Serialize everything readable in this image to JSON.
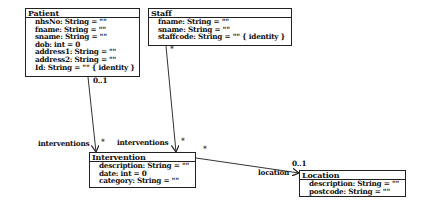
{
  "classes": {
    "patient": {
      "name": "Patient",
      "attributes": [
        "nhsNo: String = \"\"",
        "fname: String = \"\"",
        "sname: String = \"\"",
        "dob: int = 0",
        "address1: String = \"\"",
        "address2: String = \"\"",
        "Id: String = \"\" { identity }"
      ]
    },
    "staff": {
      "name": "Staff",
      "attributes": [
        "fname: String = \"\"",
        "sname: String = \"\"",
        "staffcode: String = \"\" { identity }"
      ]
    },
    "intervention": {
      "name": "Intervention",
      "attributes": [
        "description: String = \"\"",
        "date: int = 0",
        "category: String = \"\""
      ]
    },
    "location": {
      "name": "Location",
      "attributes": [
        "description: String = \"\"",
        "postcode: String = \"\""
      ]
    }
  },
  "associations": {
    "patient_intervention": {
      "source_multiplicity": "0..1",
      "role": "interventions",
      "target_multiplicity": "*"
    },
    "staff_intervention": {
      "source_multiplicity": "*",
      "role": "interventions",
      "target_multiplicity": "*"
    },
    "intervention_location": {
      "source_multiplicity": "*",
      "role": "location",
      "target_multiplicity": "0..1"
    }
  }
}
